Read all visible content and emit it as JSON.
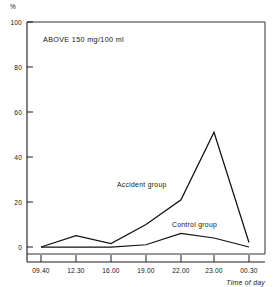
{
  "chart_data": {
    "type": "line",
    "title": "",
    "subtitle": "",
    "annotation": "ABOVE  150 mg/100 ml",
    "xlabel": "Time of day",
    "ylabel": "%",
    "categories": [
      "09.40",
      "12.30",
      "16.00",
      "19.00",
      "22.00",
      "23.00",
      "00.30"
    ],
    "x": [
      "09.40",
      "12.30",
      "16.00",
      "19.00",
      "22.00",
      "23.00",
      "00.30"
    ],
    "ylim": [
      0,
      100
    ],
    "yticks": [
      0,
      20,
      40,
      60,
      80,
      100
    ],
    "ytick_labels": [
      "0",
      "20",
      "40",
      "60",
      "80",
      "100"
    ],
    "grid": false,
    "legend_position": "inline-annotation",
    "series": [
      {
        "name": "Accident group",
        "label_text": "Accident group",
        "values": [
          0,
          5,
          1.5,
          10,
          21,
          51,
          2
        ]
      },
      {
        "name": "Control group",
        "label_text": "Control group",
        "values": [
          0,
          0,
          0,
          1,
          6,
          4,
          0
        ]
      }
    ]
  },
  "axes": {
    "y_unit": "%",
    "x_title": "Time of day"
  },
  "labels": {
    "accident_group": "Accident group",
    "control_group": "Control group",
    "annotation": "ABOVE  150 mg/100 ml"
  },
  "colors": {
    "line": "#111111",
    "axis": "#1a1a1a",
    "background": "#ffffff"
  }
}
